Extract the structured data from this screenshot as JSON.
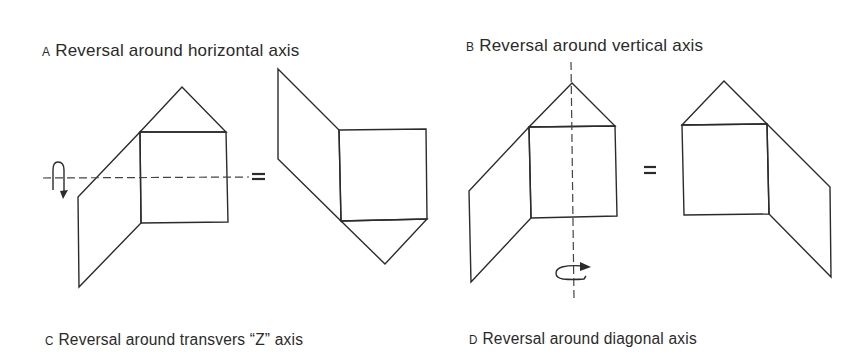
{
  "figure": {
    "panels": [
      {
        "id": "A",
        "letter": "A",
        "caption": "Reversal around horizontal axis",
        "axis": "horizontal",
        "equals": "="
      },
      {
        "id": "B",
        "letter": "B",
        "caption": "Reversal around vertical axis",
        "axis": "vertical",
        "equals": "="
      },
      {
        "id": "C",
        "letter": "C",
        "caption": "Reversal around transvers “Z” axis",
        "axis": "transverse-z"
      },
      {
        "id": "D",
        "letter": "D",
        "caption": "Reversal around diagonal axis",
        "axis": "diagonal"
      }
    ],
    "line_color": "#2b2b2b",
    "background": "#ffffff"
  }
}
